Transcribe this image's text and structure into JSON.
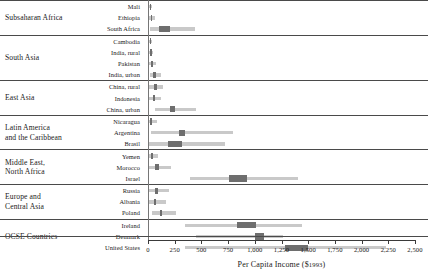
{
  "chart_data": {
    "type": "bar",
    "title": "",
    "xlabel": "Per Capita Income ($ 1993)",
    "ylabel": "",
    "xlim": [
      0,
      2500
    ],
    "grid": false,
    "legend": null,
    "axis": {
      "currency_label": "Per Capita Income ($",
      "year_label": "1993",
      "closing": ")",
      "ticks": [
        {
          "value": 0,
          "label": "0"
        },
        {
          "value": 250,
          "label": "250"
        },
        {
          "value": 500,
          "label": "500"
        },
        {
          "value": 750,
          "label": "750"
        },
        {
          "value": 1000,
          "label": "1,000"
        },
        {
          "value": 1250,
          "label": "1,250"
        },
        {
          "value": 1500,
          "label": "1,500"
        },
        {
          "value": 1750,
          "label": "1,750"
        },
        {
          "value": 2000,
          "label": "2,000"
        },
        {
          "value": 2250,
          "label": "2,250"
        },
        {
          "value": 2500,
          "label": "2,500"
        }
      ]
    },
    "groups": [
      {
        "name": "Subsaharan Africa",
        "rows": [
          {
            "label": "Mali",
            "range": [
              10,
              40
            ],
            "box": [
              18,
              26
            ]
          },
          {
            "label": "Ethiopia",
            "range": [
              10,
              70
            ],
            "box": [
              28,
              42
            ]
          },
          {
            "label": "South Africa",
            "range": [
              20,
              440
            ],
            "box": [
              105,
              205
            ]
          }
        ]
      },
      {
        "name": "South Asia",
        "rows": [
          {
            "label": "Cambodia",
            "range": [
              10,
              35
            ],
            "box": [
              16,
              24
            ]
          },
          {
            "label": "India, rural",
            "range": [
              10,
              45
            ],
            "box": [
              20,
              30
            ]
          },
          {
            "label": "Pakistan",
            "range": [
              10,
              75
            ],
            "box": [
              30,
              45
            ]
          },
          {
            "label": "India, urban",
            "range": [
              15,
              120
            ],
            "box": [
              48,
              72
            ]
          }
        ]
      },
      {
        "name": "East Asia",
        "rows": [
          {
            "label": "China, rural",
            "range": [
              0,
              140
            ],
            "box": [
              55,
              80
            ]
          },
          {
            "label": "Indonesia",
            "range": [
              0,
              120
            ],
            "box": [
              45,
              70
            ]
          },
          {
            "label": "China, urban",
            "range": [
              70,
              450
            ],
            "box": [
              210,
              255
            ]
          }
        ]
      },
      {
        "name": "Latin America\nand the Caribbean",
        "rows": [
          {
            "label": "Nicaragua",
            "range": [
              10,
              80
            ],
            "box": [
              22,
              38
            ]
          },
          {
            "label": "Argentina",
            "range": [
              30,
              800
            ],
            "box": [
              290,
              350
            ]
          },
          {
            "label": "Brasil",
            "range": [
              0,
              720
            ],
            "box": [
              190,
              320
            ]
          }
        ]
      },
      {
        "name": "Middle East,\nNorth Africa",
        "rows": [
          {
            "label": "Yemen",
            "range": [
              10,
              95
            ],
            "box": [
              28,
              45
            ]
          },
          {
            "label": "Morocco",
            "range": [
              0,
              220
            ],
            "box": [
              70,
              100
            ]
          },
          {
            "label": "Israel",
            "range": [
              390,
              1400
            ],
            "box": [
              760,
              930
            ]
          }
        ]
      },
      {
        "name": "Europe and\nCentral Asia",
        "rows": [
          {
            "label": "Russia",
            "range": [
              0,
              200
            ],
            "box": [
              70,
              95
            ]
          },
          {
            "label": "Albania",
            "range": [
              0,
              170
            ],
            "box": [
              55,
              78
            ]
          },
          {
            "label": "Poland",
            "range": [
              40,
              260
            ],
            "box": [
              115,
              135
            ]
          }
        ]
      },
      {
        "name": "OCSE Countries",
        "rows": [
          {
            "label": "Ireland",
            "range": [
              350,
              1440
            ],
            "box": [
              830,
              1010
            ]
          },
          {
            "label": "Denmark",
            "range": [
              450,
              1260
            ],
            "box": [
              1000,
              1090
            ]
          },
          {
            "label": "United States",
            "range": [
              350,
              2230
            ],
            "box": [
              1280,
              1500
            ]
          }
        ]
      }
    ]
  }
}
